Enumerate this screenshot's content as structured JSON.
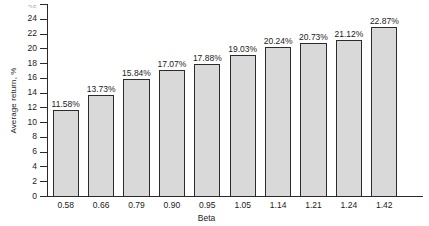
{
  "chart_data": {
    "type": "bar",
    "title": "",
    "subtitle": "",
    "xlabel": "Beta",
    "ylabel": "Average return, %",
    "categories": [
      "0.58",
      "0.66",
      "0.79",
      "0.90",
      "0.95",
      "1.05",
      "1.14",
      "1.21",
      "1.24",
      "1.42"
    ],
    "values": [
      11.58,
      13.73,
      15.84,
      17.07,
      17.88,
      19.03,
      20.24,
      20.73,
      21.12,
      22.87
    ],
    "data_labels": [
      "11.58%",
      "13.73%",
      "15.84%",
      "17.07%",
      "17.88%",
      "19.03%",
      "20.24%",
      "20.73%",
      "21.12%",
      "22.87%"
    ],
    "ylim": [
      0,
      26
    ],
    "ytick_labels": [
      "0",
      "2",
      "4",
      "6",
      "8",
      "10",
      "12",
      "14",
      "16",
      "18",
      "20",
      "22",
      "24",
      "26"
    ],
    "ytick_values": [
      0,
      2,
      4,
      6,
      8,
      10,
      12,
      14,
      16,
      18,
      20,
      22,
      24,
      26
    ],
    "grid": false,
    "legend": null,
    "legend_position": "none",
    "bar_fill_color": "#d9d9d9",
    "bar_edge_color": "#2b2b2b",
    "axis_color": "#2a2a2a",
    "text_color": "#1b1b1b",
    "background_color": "#ffffff",
    "top_tick_clipped": true
  }
}
